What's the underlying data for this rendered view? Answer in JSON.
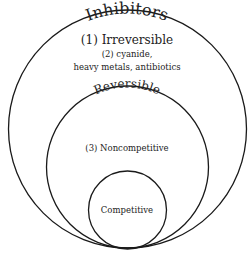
{
  "diagram": {
    "type": "nested-circles",
    "outer": {
      "label": "Inhibitors",
      "items": [
        "(1) Irreversible",
        "(2) cyanide,",
        "heavy metals, antibiotics"
      ]
    },
    "middle": {
      "label": "Reversible",
      "items": [
        "(3) Noncompetitive"
      ]
    },
    "inner": {
      "label": "Competitive"
    }
  },
  "colors": {
    "stroke": "#1a1a1a",
    "text": "#222222",
    "background": "#ffffff"
  }
}
